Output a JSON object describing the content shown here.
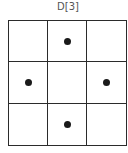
{
  "title": "D[3]",
  "grid": {
    "rows": 3,
    "cols": 3,
    "cells": [
      [
        false,
        true,
        false
      ],
      [
        true,
        false,
        true
      ],
      [
        false,
        true,
        false
      ]
    ]
  },
  "colors": {
    "line": "#2b2b2b",
    "dot": "#1a1a1a",
    "title": "#555555"
  }
}
